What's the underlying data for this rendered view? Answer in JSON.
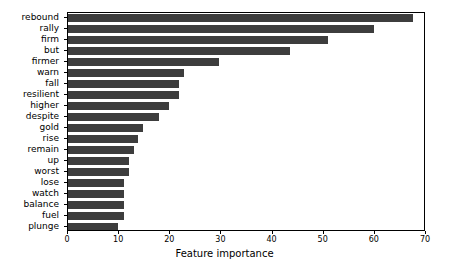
{
  "chart_data": {
    "type": "bar",
    "orientation": "horizontal",
    "title": "",
    "xlabel": "Feature importance",
    "ylabel": "",
    "xlim": [
      0,
      70
    ],
    "ylim": [
      0,
      20
    ],
    "xticks": [
      0,
      10,
      20,
      30,
      40,
      50,
      60,
      70
    ],
    "xticklabels": [
      "0",
      "10",
      "20",
      "30",
      "40",
      "50",
      "60",
      "70"
    ],
    "grid": false,
    "legend": null,
    "bar_color": "#3d3d3d",
    "background_color": "#ffffff",
    "axes_edge_color": "#000000",
    "categories": [
      "rebound",
      "rally",
      "firm",
      "but",
      "firmer",
      "warn",
      "fall",
      "resilient",
      "higher",
      "despite",
      "gold",
      "rise",
      "remain",
      "up",
      "worst",
      "lose",
      "watch",
      "balance",
      "fuel",
      "plunge"
    ],
    "values": [
      67.5,
      59.8,
      50.8,
      43.5,
      29.5,
      22.6,
      21.8,
      21.8,
      19.7,
      17.8,
      14.7,
      13.7,
      12.9,
      11.9,
      11.9,
      11.0,
      11.0,
      11.0,
      11.0,
      9.8
    ]
  }
}
